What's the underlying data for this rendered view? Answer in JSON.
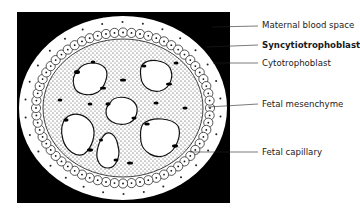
{
  "figure": {
    "type": "histology-cross-section",
    "colors": {
      "background": "#000000",
      "tissue": "#ffffff",
      "ink": "#111111"
    }
  },
  "labels": [
    {
      "id": "maternal-blood-space",
      "text": "Maternal blood space"
    },
    {
      "id": "syncytiotrophoblast",
      "text": "Syncytiotrophoblast"
    },
    {
      "id": "cytotrophoblast",
      "text": "Cytotrophoblast"
    },
    {
      "id": "fetal-mesenchyme",
      "text": "Fetal mesenchyme"
    },
    {
      "id": "fetal-capillary",
      "text": "Fetal capillary"
    }
  ]
}
